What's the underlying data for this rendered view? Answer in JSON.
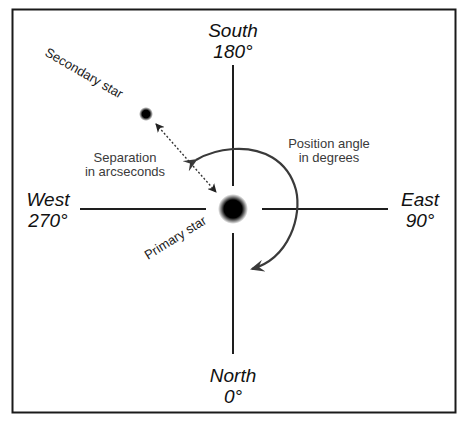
{
  "diagram": {
    "directions": {
      "south": {
        "name": "South",
        "degrees": "180°"
      },
      "north": {
        "name": "North",
        "degrees": "0°"
      },
      "west": {
        "name": "West",
        "degrees": "270°"
      },
      "east": {
        "name": "East",
        "degrees": "90°"
      }
    },
    "labels": {
      "secondary_star": "Secondary star",
      "primary_star": "Primary star",
      "separation_line1": "Separation",
      "separation_line2": "in arcseconds",
      "position_angle_line1": "Position angle",
      "position_angle_line2": "in degrees"
    },
    "colors": {
      "frame": "#1a1a1a",
      "axes": "#1e1e1e",
      "arc": "#3a3a3a",
      "star": "#000000",
      "background": "#ffffff"
    }
  }
}
